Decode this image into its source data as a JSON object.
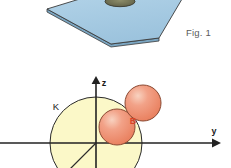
{
  "figure": {
    "caption": "Fig. 1",
    "background_color": "#ffffff"
  },
  "top_panel": {
    "name": "inclined-plane-3d",
    "plane": {
      "label": "blue-plane",
      "fill_color": "#9ec6e0",
      "top_face_color": "#a8cde4",
      "edge_color": "#3a3a3a",
      "side_face_color": "#7fa9c4"
    },
    "hole": {
      "label": "dark-ellipse-hole",
      "fill_color": "#6b6b52",
      "stroke_color": "#3a3a3a"
    }
  },
  "bottom_panel": {
    "name": "coordinate-sphere-diagram",
    "axes": {
      "z_label": "z",
      "y_label": "y",
      "axis_color": "#222222",
      "origin_label": ""
    },
    "circle": {
      "label": "K",
      "fill_color": "#fbf8c8",
      "stroke_color": "#2a2a2a"
    },
    "radius_line": {
      "label": "radius-line",
      "color": "#2a2a2a"
    },
    "spheres": [
      {
        "label": "",
        "name": "sphere-lower",
        "fill_color": "#ef9077",
        "highlight_color": "#f6c3ae",
        "stroke_color": "#8a4a33"
      },
      {
        "label": "B",
        "name": "sphere-upper-b",
        "fill_color": "#ef9077",
        "highlight_color": "#f6c3ae",
        "stroke_color": "#8a4a33"
      }
    ]
  }
}
